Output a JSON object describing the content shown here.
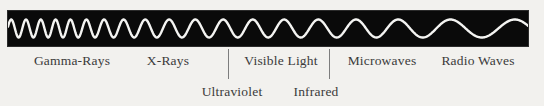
{
  "figure": {
    "name": "electromagnetic-spectrum-diagram",
    "background_color": "#f2f1ee",
    "bar_color": "#0a0a0a",
    "wave_color": "#f4f4f2",
    "text_color": "#3b3b3b",
    "divider_color": "#7d7d7d"
  },
  "bands": [
    {
      "id": "gamma-rays",
      "label": "Gamma-Rays",
      "row": 1,
      "center_x": 72,
      "cycles": 8,
      "relative_frequency": "highest"
    },
    {
      "id": "x-rays",
      "label": "X-Rays",
      "row": 1,
      "center_x": 168,
      "cycles": 5,
      "relative_frequency": "very-high"
    },
    {
      "id": "ultraviolet",
      "label": "Ultraviolet",
      "row": 2,
      "center_x": 232,
      "cycles": 3,
      "relative_frequency": "high"
    },
    {
      "id": "visible-light",
      "label": "Visible Light",
      "row": 1,
      "center_x": 281,
      "cycles": 3,
      "relative_frequency": "medium"
    },
    {
      "id": "infrared",
      "label": "Infrared",
      "row": 2,
      "center_x": 316,
      "cycles": 2.5,
      "relative_frequency": "medium-low"
    },
    {
      "id": "microwaves",
      "label": "Microwaves",
      "row": 1,
      "center_x": 382,
      "cycles": 2.5,
      "relative_frequency": "low"
    },
    {
      "id": "radio-waves",
      "label": "Radio Waves",
      "row": 1,
      "center_x": 478,
      "cycles": 1.5,
      "relative_frequency": "lowest"
    }
  ],
  "dividers": [
    {
      "id": "divider-visible-left",
      "x": 228
    },
    {
      "id": "divider-visible-right",
      "x": 329
    }
  ],
  "wave": {
    "description": "continuous sine wave with frequency decreasing from left to right",
    "segments": [
      {
        "band": "gamma-rays",
        "x_start": 0,
        "x_end": 118,
        "wavelength": 14.8
      },
      {
        "band": "x-rays",
        "x_start": 118,
        "x_end": 222,
        "wavelength": 26
      },
      {
        "band": "uv-visible",
        "x_start": 222,
        "x_end": 320,
        "wavelength": 32
      },
      {
        "band": "microwaves",
        "x_start": 320,
        "x_end": 425,
        "wavelength": 42
      },
      {
        "band": "radio-waves",
        "x_start": 425,
        "x_end": 520,
        "wavelength": 66
      }
    ],
    "amplitude": 9,
    "midline_y": 17.5
  }
}
